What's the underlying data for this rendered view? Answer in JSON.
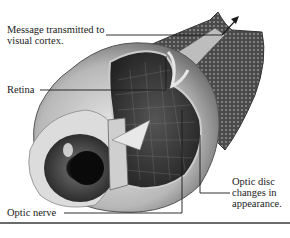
{
  "figure": {
    "labels": {
      "message": {
        "line1": "Message transmitted to",
        "line2": "visual cortex."
      },
      "retina": "Retina",
      "optic_nerve": "Optic nerve",
      "optic_disc": {
        "line1": "Optic disc",
        "line2": "changes in",
        "line3": "appearance."
      }
    }
  },
  "colors": {
    "background": "#ffffff",
    "text": "#1a1a1a",
    "leader_line": "#1a1a1a",
    "rule": "#6a6a6a"
  }
}
